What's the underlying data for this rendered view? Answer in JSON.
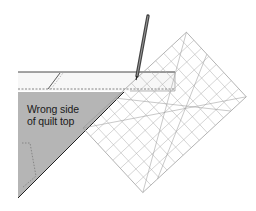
{
  "diagram": {
    "label_line1": "Wrong side",
    "label_line2": "of quilt top",
    "colors": {
      "quilt_fill": "#b5b5b5",
      "outline": "#2a2a2a",
      "ruler_grid": "#a8a8a8",
      "strip_fill": "#f7f7f7",
      "pencil": "#555555"
    }
  }
}
